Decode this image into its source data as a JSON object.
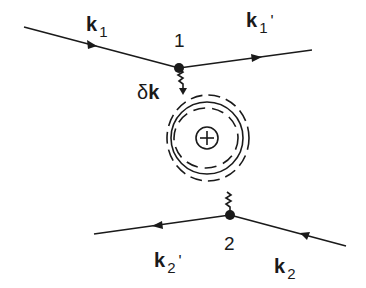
{
  "diagram": {
    "labels": {
      "k1": {
        "main": "k",
        "sub": "1",
        "prime": ""
      },
      "k1p": {
        "main": "k",
        "sub": "1",
        "prime": "'"
      },
      "k2": {
        "main": "k",
        "sub": "2",
        "prime": ""
      },
      "k2p": {
        "main": "k",
        "sub": "2",
        "prime": "'"
      },
      "dk": {
        "delta": "δ",
        "main": "k"
      },
      "v1": "1",
      "v2": "2",
      "center": "+"
    },
    "colors": {
      "ink": "#1a1a1a",
      "background": "#ffffff"
    }
  }
}
